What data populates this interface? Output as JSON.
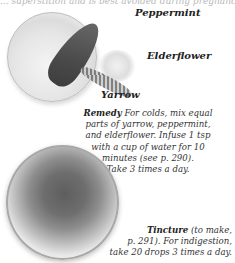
{
  "page": {
    "top_cut_text": "... superstition and is best avoided during pregnancy."
  },
  "illustration": {
    "labels": {
      "peppermint": "Peppermint",
      "elderflower": "Elderflower",
      "yarrow": "Yarrow"
    }
  },
  "remedy": {
    "heading": "Remedy",
    "lines": [
      "For colds, mix equal",
      "parts of yarrow, peppermint,",
      "and elderflower. Infuse 1 tsp",
      "with a cup of water for 10",
      "minutes (see p. 290).",
      "Take 3 times a day."
    ]
  },
  "tincture": {
    "heading": "Tincture",
    "lines": [
      "(to make,",
      "p. 291). For indigestion,",
      "take 20 drops 3 times a day."
    ]
  }
}
